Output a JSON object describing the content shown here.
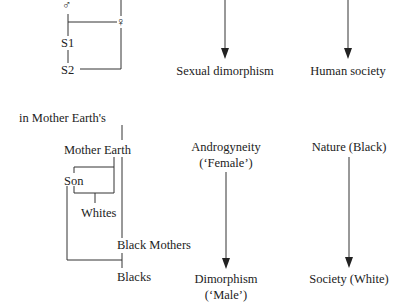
{
  "top_left": {
    "male_symbol": "♂",
    "female_symbol": "♀",
    "s1": "S1",
    "s2": "S2"
  },
  "top_middle": {
    "label": "Sexual dimorphism"
  },
  "top_right": {
    "label": "Human society"
  },
  "bottom_left": {
    "caption": "in Mother Earth's",
    "mother_earth": "Mother Earth",
    "son": "Son",
    "whites": "Whites",
    "black_mothers": "Black Mothers",
    "blacks": "Blacks"
  },
  "bottom_middle": {
    "top_line1": "Androgyneity",
    "top_line2": "(‘Female’)",
    "bottom_line1": "Dimorphism",
    "bottom_line2": "(‘Male’)"
  },
  "bottom_right": {
    "top": "Nature (Black)",
    "bottom": "Society (White)"
  }
}
